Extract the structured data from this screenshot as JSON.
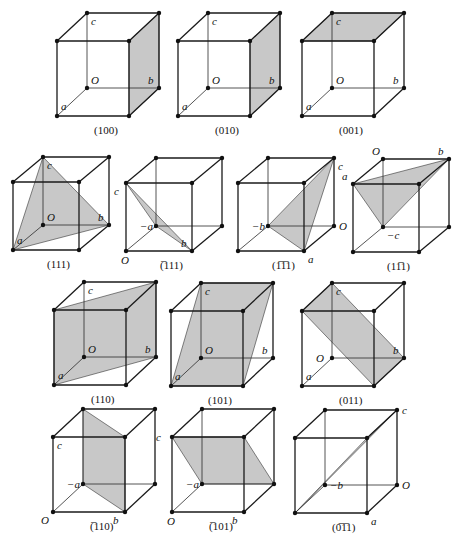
{
  "figure": {
    "colors": {
      "plane_fill": "#c8c8c8",
      "edge": "#1a1a1a"
    },
    "cubes": [
      {
        "id": "100",
        "caption": "(100)",
        "caption_bar": "",
        "plane": [
          [
            1,
            0,
            0
          ],
          [
            1,
            0,
            1
          ],
          [
            1,
            1,
            1
          ],
          [
            1,
            1,
            0
          ]
        ],
        "plane_note": "front face",
        "labels": [
          {
            "text": "c",
            "at": [
              0,
              1,
              1
            ],
            "pos": "below-right"
          },
          {
            "text": "O",
            "at": [
              0,
              0,
              1
            ],
            "pos": "above-right"
          },
          {
            "text": "b",
            "at": [
              1,
              0,
              1
            ],
            "pos": "above-left"
          },
          {
            "text": "a",
            "at": [
              0,
              0,
              0
            ],
            "pos": "above-mid"
          }
        ]
      },
      {
        "id": "010",
        "caption": "(010)",
        "plane": [
          [
            1,
            0,
            0
          ],
          [
            1,
            0,
            1
          ],
          [
            1,
            1,
            1
          ],
          [
            1,
            1,
            0
          ]
        ],
        "labels": [
          {
            "text": "c",
            "at": [
              0,
              1,
              1
            ],
            "pos": "below-right"
          },
          {
            "text": "O",
            "at": [
              0,
              0,
              1
            ],
            "pos": "above-right"
          },
          {
            "text": "b",
            "at": [
              1,
              0,
              1
            ],
            "pos": "above-left"
          },
          {
            "text": "a",
            "at": [
              0,
              0,
              0
            ],
            "pos": "above-mid"
          }
        ]
      },
      {
        "id": "001",
        "caption": "(001)",
        "plane": [
          [
            0,
            1,
            0
          ],
          [
            1,
            1,
            0
          ],
          [
            1,
            1,
            1
          ],
          [
            0,
            1,
            1
          ]
        ],
        "labels": [
          {
            "text": "c",
            "at": [
              0,
              1,
              1
            ],
            "pos": "below-right"
          },
          {
            "text": "O",
            "at": [
              0,
              0,
              1
            ],
            "pos": "above-right"
          },
          {
            "text": "b",
            "at": [
              1,
              0,
              1
            ],
            "pos": "above-left"
          },
          {
            "text": "a",
            "at": [
              0,
              0,
              0
            ],
            "pos": "above-mid"
          }
        ]
      },
      {
        "id": "111",
        "caption": "(111)",
        "plane": [
          [
            0,
            0,
            0
          ],
          [
            1,
            0,
            1
          ],
          [
            0,
            1,
            1
          ]
        ],
        "labels": [
          {
            "text": "c",
            "at": [
              0,
              1,
              1
            ],
            "pos": "below-right"
          },
          {
            "text": "O",
            "at": [
              0,
              0,
              1
            ],
            "pos": "above-right"
          },
          {
            "text": "b",
            "at": [
              1,
              0,
              1
            ],
            "pos": "above-left"
          },
          {
            "text": "a",
            "at": [
              0,
              0,
              0
            ],
            "pos": "above-mid"
          }
        ]
      },
      {
        "id": "-111",
        "caption": "(̅111)",
        "plane": [
          [
            0,
            1,
            0
          ],
          [
            0,
            0,
            1
          ],
          [
            1,
            0,
            0
          ]
        ],
        "labels": [
          {
            "text": "c",
            "at": [
              0,
              1,
              0
            ],
            "pos": "below-left"
          },
          {
            "text": "−a",
            "at": [
              0,
              0,
              1
            ],
            "pos": "left"
          },
          {
            "text": "b",
            "at": [
              1,
              0,
              0
            ],
            "pos": "above-left"
          },
          {
            "text": "O",
            "at": [
              0,
              0,
              0
            ],
            "pos": "below"
          }
        ]
      },
      {
        "id": "1-11",
        "caption": "(1̅1̅1)",
        "plane": [
          [
            1,
            1,
            1
          ],
          [
            0,
            0,
            1
          ],
          [
            1,
            0,
            0
          ]
        ],
        "labels": [
          {
            "text": "c",
            "at": [
              1,
              1,
              1
            ],
            "pos": "below-right"
          },
          {
            "text": "−b",
            "at": [
              0,
              0,
              1
            ],
            "pos": "left"
          },
          {
            "text": "O",
            "at": [
              1,
              0,
              1
            ],
            "pos": "right"
          },
          {
            "text": "a",
            "at": [
              1,
              0,
              0
            ],
            "pos": "below-right"
          }
        ]
      },
      {
        "id": "11-1",
        "caption": "(11̅1)",
        "plane": [
          [
            0,
            1,
            0
          ],
          [
            1,
            1,
            1
          ],
          [
            0,
            0,
            1
          ]
        ],
        "labels": [
          {
            "text": "O",
            "at": [
              0,
              1,
              1
            ],
            "pos": "above-left"
          },
          {
            "text": "b",
            "at": [
              1,
              1,
              1
            ],
            "pos": "above-left"
          },
          {
            "text": "a",
            "at": [
              0,
              1,
              0
            ],
            "pos": "above-left"
          },
          {
            "text": "−c",
            "at": [
              0,
              0,
              1
            ],
            "pos": "below-right"
          }
        ]
      },
      {
        "id": "110",
        "caption": "(110)",
        "plane": [
          [
            0,
            0,
            0
          ],
          [
            1,
            0,
            1
          ],
          [
            1,
            1,
            1
          ],
          [
            0,
            1,
            0
          ]
        ],
        "labels": [
          {
            "text": "c",
            "at": [
              0,
              1,
              1
            ],
            "pos": "below-right"
          },
          {
            "text": "O",
            "at": [
              0,
              0,
              1
            ],
            "pos": "above-right"
          },
          {
            "text": "b",
            "at": [
              1,
              0,
              1
            ],
            "pos": "above-left"
          },
          {
            "text": "a",
            "at": [
              0,
              0,
              0
            ],
            "pos": "above-mid"
          }
        ]
      },
      {
        "id": "101",
        "caption": "(101)",
        "plane": [
          [
            0,
            0,
            0
          ],
          [
            1,
            0,
            0
          ],
          [
            1,
            1,
            1
          ],
          [
            0,
            1,
            1
          ]
        ],
        "labels": [
          {
            "text": "c",
            "at": [
              0,
              1,
              1
            ],
            "pos": "below-right"
          },
          {
            "text": "O",
            "at": [
              0,
              0,
              1
            ],
            "pos": "above-right"
          },
          {
            "text": "b",
            "at": [
              1,
              0,
              1
            ],
            "pos": "above-left"
          },
          {
            "text": "a",
            "at": [
              0,
              0,
              0
            ],
            "pos": "above-mid"
          }
        ]
      },
      {
        "id": "011",
        "caption": "(011)",
        "plane": [
          [
            0,
            1,
            0
          ],
          [
            0,
            1,
            1
          ],
          [
            1,
            0,
            1
          ],
          [
            1,
            0,
            0
          ]
        ],
        "labels": [
          {
            "text": "c",
            "at": [
              0,
              1,
              1
            ],
            "pos": "below-right"
          },
          {
            "text": "O",
            "at": [
              0,
              0,
              1
            ],
            "pos": "left"
          },
          {
            "text": "b",
            "at": [
              1,
              0,
              1
            ],
            "pos": "above-left"
          },
          {
            "text": "a",
            "at": [
              0,
              0,
              0
            ],
            "pos": "above-mid"
          }
        ]
      },
      {
        "id": "-110",
        "caption": "(̅110)",
        "plane": [
          [
            0,
            1,
            1
          ],
          [
            1,
            1,
            0
          ],
          [
            1,
            0,
            0
          ],
          [
            0,
            0,
            1
          ]
        ],
        "labels": [
          {
            "text": "c",
            "at": [
              0,
              1,
              0
            ],
            "pos": "below-right"
          },
          {
            "text": "−a",
            "at": [
              0,
              0,
              1
            ],
            "pos": "left"
          },
          {
            "text": "O",
            "at": [
              0,
              0,
              0
            ],
            "pos": "below-left"
          },
          {
            "text": "b",
            "at": [
              1,
              0,
              0
            ],
            "pos": "below-left"
          }
        ]
      },
      {
        "id": "-101",
        "caption": "(̅101)",
        "plane": [
          [
            0,
            1,
            0
          ],
          [
            1,
            1,
            0
          ],
          [
            1,
            0,
            1
          ],
          [
            0,
            0,
            1
          ]
        ],
        "labels": [
          {
            "text": "c",
            "at": [
              0,
              1,
              0
            ],
            "pos": "left"
          },
          {
            "text": "−a",
            "at": [
              0,
              0,
              1
            ],
            "pos": "left"
          },
          {
            "text": "O",
            "at": [
              0,
              0,
              0
            ],
            "pos": "below"
          },
          {
            "text": "b",
            "at": [
              1,
              0,
              0
            ],
            "pos": "below-left"
          }
        ]
      },
      {
        "id": "0-11",
        "caption": "(0̅1̅1)",
        "plane": [
          [
            0,
            0,
            0
          ],
          [
            1,
            1,
            1
          ],
          [
            1,
            1,
            0
          ]
        ],
        "labels": [
          {
            "text": "c",
            "at": [
              1,
              1,
              1
            ],
            "pos": "right"
          },
          {
            "text": "−b",
            "at": [
              0,
              0,
              1
            ],
            "pos": "right"
          },
          {
            "text": "O",
            "at": [
              1,
              0,
              1
            ],
            "pos": "right"
          },
          {
            "text": "a",
            "at": [
              1,
              0,
              0
            ],
            "pos": "below-right"
          }
        ]
      }
    ]
  }
}
